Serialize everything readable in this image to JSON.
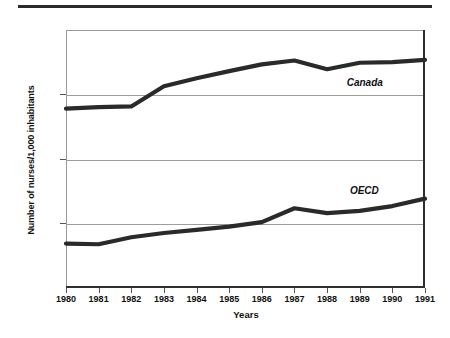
{
  "chart_data": {
    "type": "line",
    "title": "",
    "xlabel": "Years",
    "ylabel": "Number of nurses/1,000 inhabitants",
    "categories": [
      "1980",
      "1981",
      "1982",
      "1983",
      "1984",
      "1985",
      "1986",
      "1987",
      "1988",
      "1989",
      "1990",
      "1991"
    ],
    "x": [
      1980,
      1981,
      1982,
      1983,
      1984,
      1985,
      1986,
      1987,
      1988,
      1989,
      1990,
      1991
    ],
    "ylim": [
      4,
      12
    ],
    "xlim": [
      1980,
      1991
    ],
    "yticks": [
      4,
      6,
      8,
      10,
      12
    ],
    "ytick_labels": [
      "4",
      "6",
      "8",
      "10",
      "12"
    ],
    "grid": true,
    "grid_values": [
      6,
      8,
      10
    ],
    "legend": "inline-labels",
    "series": [
      {
        "name": "Canada",
        "values": [
          9.55,
          9.6,
          9.62,
          10.25,
          10.5,
          10.72,
          10.93,
          11.05,
          10.78,
          10.98,
          11.0,
          11.07
        ],
        "color": "#2a2a2a",
        "label_x": 1988.6,
        "label_y": 10.35
      },
      {
        "name": "OECD",
        "values": [
          5.35,
          5.33,
          5.55,
          5.68,
          5.78,
          5.88,
          6.02,
          6.45,
          6.3,
          6.37,
          6.52,
          6.75
        ],
        "color": "#2a2a2a",
        "label_x": 1988.7,
        "label_y": 7.0
      }
    ]
  },
  "axes": {
    "y_title": "Number of nurses/1,000 inhabitants",
    "x_title": "Years"
  },
  "colors": {
    "line": "#2a2a2a",
    "grid": "#9d9d9d",
    "frame": "#9a9a9a",
    "rule": "#2b2b2b",
    "text": "#111111"
  }
}
